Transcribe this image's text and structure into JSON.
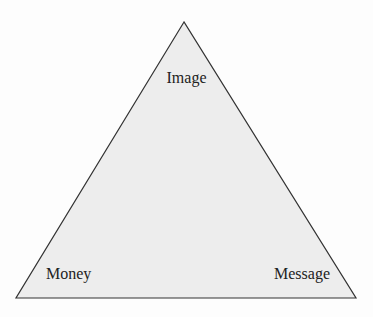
{
  "diagram": {
    "type": "triangle",
    "fill_color": "#ededed",
    "stroke_color": "#333333",
    "vertices": {
      "top": "Image",
      "bottom_left": "Money",
      "bottom_right": "Message"
    },
    "labels": {
      "top": "Image",
      "bottom_left": "Money",
      "bottom_right": "Message"
    }
  }
}
